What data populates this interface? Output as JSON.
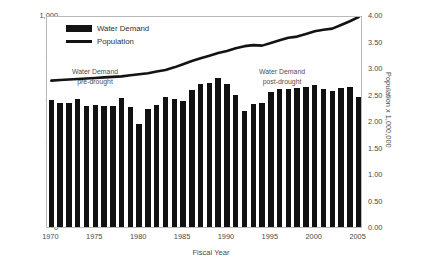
{
  "chart_data": {
    "type": "bar",
    "title": "",
    "xlabel": "Fiscal Year",
    "ylabel": "",
    "ylabel_right": "Population x 1,000,000",
    "ylim": [
      0,
      1000
    ],
    "ylim_right": [
      0,
      4.0
    ],
    "yticks": [
      "0",
      "100",
      "200",
      "300",
      "400",
      "500",
      "600",
      "700",
      "800",
      "900",
      "1,000"
    ],
    "yticks_right": [
      "0.00",
      "0.50",
      "1.00",
      "1.50",
      "2.00",
      "2.50",
      "3.00",
      "3.50",
      "4.00"
    ],
    "xticks": [
      "1970",
      "1975",
      "1980",
      "1985",
      "1990",
      "1995",
      "2000",
      "2005"
    ],
    "grid": false,
    "legend_position": "upper-left",
    "categories": [
      "1970",
      "1971",
      "1972",
      "1973",
      "1974",
      "1975",
      "1976",
      "1977",
      "1978",
      "1979",
      "1980",
      "1981",
      "1982",
      "1983",
      "1984",
      "1985",
      "1986",
      "1987",
      "1988",
      "1989",
      "1990",
      "1991",
      "1992",
      "1993",
      "1994",
      "1995",
      "1996",
      "1997",
      "1998",
      "1999",
      "2000",
      "2001",
      "2002",
      "2003",
      "2004",
      "2005"
    ],
    "series": [
      {
        "name": "Water Demand",
        "axis": "left",
        "type": "bar",
        "values": [
          598,
          585,
          584,
          602,
          572,
          574,
          572,
          570,
          610,
          566,
          487,
          556,
          575,
          615,
          605,
          593,
          648,
          676,
          677,
          702,
          676,
          621,
          548,
          582,
          584,
          638,
          653,
          650,
          654,
          659,
          668,
          650,
          643,
          655,
          662,
          611
        ]
      },
      {
        "name": "Population",
        "axis": "right",
        "type": "line",
        "values": [
          2.8,
          2.81,
          2.82,
          2.83,
          2.84,
          2.85,
          2.86,
          2.87,
          2.88,
          2.9,
          2.92,
          2.94,
          2.97,
          3.0,
          3.05,
          3.11,
          3.17,
          3.22,
          3.27,
          3.32,
          3.36,
          3.41,
          3.45,
          3.47,
          3.46,
          3.51,
          3.56,
          3.61,
          3.63,
          3.68,
          3.73,
          3.76,
          3.78,
          3.85,
          3.92,
          4.0
        ]
      }
    ],
    "annotations": [
      {
        "id": "pre",
        "line1": "Water Demand",
        "line2": "pre-drought"
      },
      {
        "id": "post",
        "line1": "Water Demand",
        "line2": "post-drought"
      }
    ]
  },
  "legend": {
    "items": [
      {
        "label": "Water Demand",
        "marker": "bar-swatch",
        "color": "#131313"
      },
      {
        "label": "Population",
        "marker": "line-swatch",
        "color": "#131313"
      }
    ]
  },
  "colors": {
    "bar": "#111111",
    "line": "#131313",
    "frame": "#b9b9b9",
    "text": "#4a4a4a",
    "background": "#ffffff"
  }
}
